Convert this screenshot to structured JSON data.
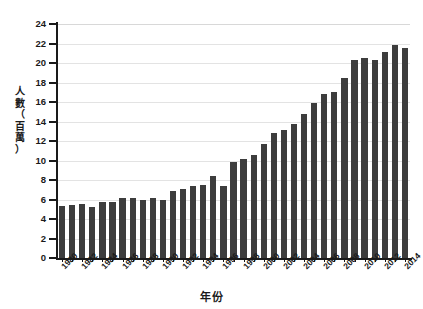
{
  "chart_data": {
    "type": "bar",
    "title": "",
    "xlabel": "年份",
    "ylabel": "人數（百萬）",
    "ylabel_chars": [
      "人",
      "數",
      "（",
      "百",
      "萬",
      "）"
    ],
    "ylim": [
      0,
      24
    ],
    "ytick_step": 2,
    "ytick_labels": [
      "24",
      "22",
      "20",
      "18",
      "16",
      "14",
      "12",
      "10",
      "8",
      "6",
      "4",
      "2",
      "0"
    ],
    "grid": "horizontal",
    "legend": "none",
    "bar_color": "#3d3d3d",
    "grid_color": "#e3e3e3",
    "axis_color": "#1a1a1a",
    "xtick_label_every": 2,
    "xtick_labels_shown": [
      "1980",
      "1982",
      "1984",
      "1986",
      "1988",
      "1990",
      "1992",
      "1994",
      "1996",
      "1998",
      "2000",
      "2002",
      "2004",
      "2006",
      "2008",
      "2010",
      "2012",
      "2014"
    ],
    "categories": [
      "1980",
      "1981",
      "1982",
      "1983",
      "1984",
      "1985",
      "1986",
      "1987",
      "1988",
      "1989",
      "1990",
      "1991",
      "1992",
      "1993",
      "1994",
      "1995",
      "1996",
      "1997",
      "1998",
      "1999",
      "2000",
      "2001",
      "2002",
      "2003",
      "2004",
      "2005",
      "2006",
      "2007",
      "2008",
      "2009",
      "2010",
      "2011",
      "2012",
      "2013",
      "2014"
    ],
    "values": [
      5.3,
      5.45,
      5.55,
      5.25,
      5.75,
      5.75,
      6.15,
      6.15,
      5.9,
      6.15,
      5.9,
      6.9,
      7.05,
      7.4,
      7.45,
      8.4,
      7.35,
      9.85,
      10.2,
      10.6,
      11.7,
      12.8,
      13.15,
      13.75,
      14.75,
      15.85,
      16.8,
      17.05,
      18.45,
      20.3,
      20.55,
      20.3,
      21.1,
      21.8,
      21.55
    ]
  }
}
